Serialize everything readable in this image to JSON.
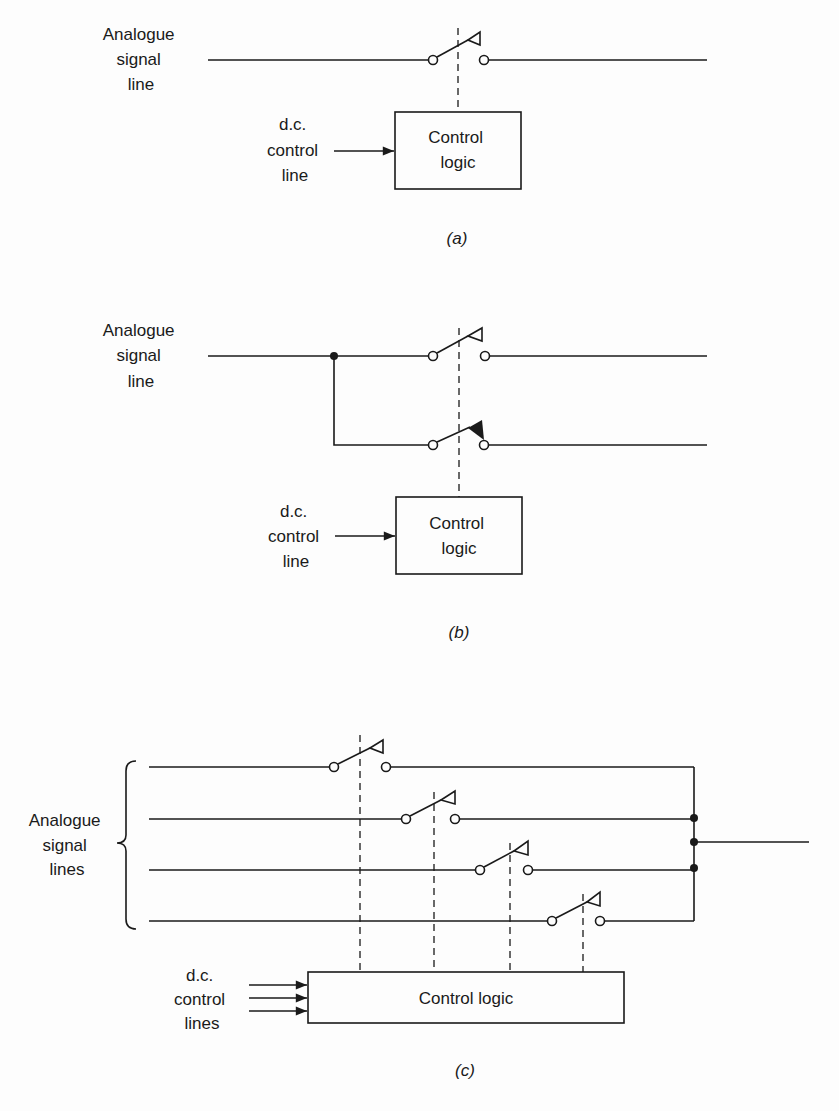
{
  "panel_a": {
    "caption": "(a)",
    "signal_label": [
      "Analogue",
      "signal",
      "line"
    ],
    "control_label": [
      "d.c.",
      "control",
      "line"
    ],
    "box_label": [
      "Control",
      "logic"
    ]
  },
  "panel_b": {
    "caption": "(b)",
    "signal_label": [
      "Analogue",
      "signal",
      "line"
    ],
    "control_label": [
      "d.c.",
      "control",
      "line"
    ],
    "box_label": [
      "Control",
      "logic"
    ]
  },
  "panel_c": {
    "caption": "(c)",
    "signal_label": [
      "Analogue",
      "signal",
      "lines"
    ],
    "control_label": [
      "d.c.",
      "control",
      "lines"
    ],
    "box_label": "Control logic",
    "switch_count": 4
  },
  "colors": {
    "ink": "#1a1a1a",
    "paper": "#fdfdfd"
  }
}
